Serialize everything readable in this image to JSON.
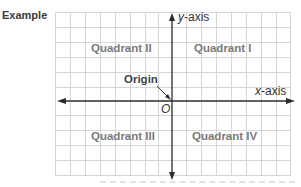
{
  "header": {
    "example_label": "Example"
  },
  "diagram": {
    "quadrants": {
      "q1": "Quadrant I",
      "q2": "Quadrant II",
      "q3": "Quadrant III",
      "q4": "Quadrant IV"
    },
    "axes": {
      "x_label_var": "x",
      "x_label_suffix": "-axis",
      "y_label_var": "y",
      "y_label_suffix": "-axis"
    },
    "origin": {
      "label": "Origin",
      "symbol": "O"
    },
    "colors": {
      "grid": "#d4d4d4",
      "axis": "#2b2b2b",
      "quadrant_text": "#7a7a7a"
    }
  }
}
